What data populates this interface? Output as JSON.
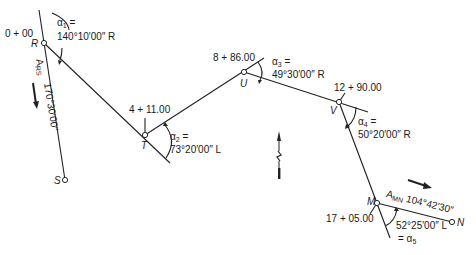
{
  "diagram": {
    "type": "route traverse / horizontal alignment sketch",
    "points": [
      {
        "name": "R",
        "station": "0 + 00"
      },
      {
        "name": "T",
        "station": "4 + 11.00"
      },
      {
        "name": "U",
        "station": "8 + 86.00"
      },
      {
        "name": "V",
        "station": "12 + 90.00"
      },
      {
        "name": "M",
        "station": "17 + 05.00"
      },
      {
        "name": "N",
        "station": ""
      },
      {
        "name": "S",
        "station": ""
      }
    ],
    "angles": [
      {
        "symbol": "α",
        "index": "1",
        "eq": "=",
        "value": "140°10′00″ R"
      },
      {
        "symbol": "α",
        "index": "2",
        "eq": "=",
        "value": "73°20′00″ L"
      },
      {
        "symbol": "α",
        "index": "3",
        "eq": "=",
        "value": "49°30′00″ R"
      },
      {
        "symbol": "α",
        "index": "4",
        "eq": "=",
        "value": "50°20′00″ R"
      },
      {
        "symbol": "α",
        "index": "5",
        "eq": "= α",
        "value": "52°25′00″ L"
      }
    ],
    "azimuths": [
      {
        "label": "A",
        "sub": "RS",
        "value": "170°30′00″"
      },
      {
        "label": "A",
        "sub": "MN",
        "value": "104°42′30″"
      }
    ],
    "north_arrow": "north-arrow"
  }
}
